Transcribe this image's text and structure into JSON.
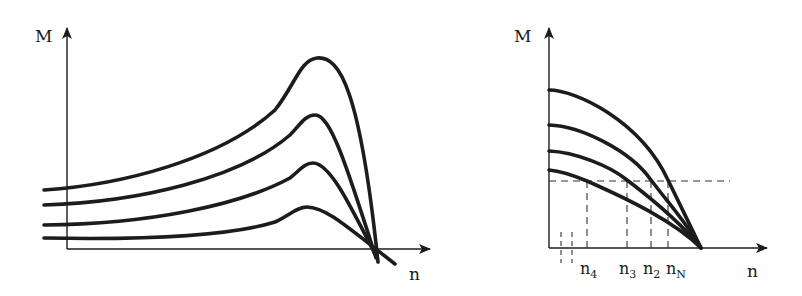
{
  "diagrams": [
    {
      "id": "left",
      "y_axis_label": "M",
      "x_axis_label": "n",
      "description": "Four torque-speed curves with pronounced peaks, converging near the x-axis at high n"
    },
    {
      "id": "right",
      "y_axis_label": "M",
      "x_axis_label": "n",
      "description": "Four monotonically decreasing torque-speed curves converging at one point on the n-axis; a horizontal dashed load line intersects them",
      "tick_labels": {
        "n4": {
          "base": "n",
          "sub": "4"
        },
        "n3": {
          "base": "n",
          "sub": "3"
        },
        "n2": {
          "base": "n",
          "sub": "2"
        },
        "nN": {
          "base": "n",
          "sub": "N"
        }
      }
    }
  ],
  "colors": {
    "line": "#1c1c1c",
    "background": "#ffffff"
  }
}
